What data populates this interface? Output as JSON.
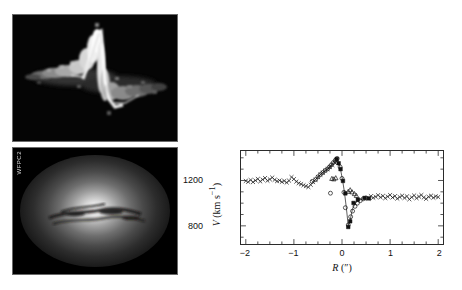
{
  "figure": {
    "panels": [
      {
        "id": "stis",
        "label": "STIS",
        "kind": "position-velocity-spectrogram"
      },
      {
        "id": "wfpc2",
        "label": "WFPC2",
        "kind": "optical-galaxy-image"
      }
    ]
  },
  "chart_data": {
    "type": "scatter",
    "title": "",
    "xlabel": "R (″)",
    "ylabel": "V (km s⁻¹)",
    "xlim": [
      -2.1,
      2.1
    ],
    "ylim": [
      640,
      1460
    ],
    "xticks": [
      -2,
      -1,
      0,
      1,
      2
    ],
    "xticklabels": [
      "−2",
      "−1",
      "0",
      "1",
      "2"
    ],
    "yticks": [
      800,
      1200
    ],
    "yticklabels": [
      "800",
      "1200"
    ],
    "minor_xticks": [
      -1.75,
      -1.5,
      -1.25,
      -0.75,
      -0.5,
      -0.25,
      0.25,
      0.5,
      0.75,
      1.25,
      1.5,
      1.75
    ],
    "minor_yticks": [
      700,
      900,
      1000,
      1100,
      1300,
      1400
    ],
    "grid": false,
    "legend": false,
    "series": [
      {
        "name": "ground-based long-slit (crosses)",
        "marker": "x",
        "points": [
          [
            -2.0,
            1196
          ],
          [
            -1.95,
            1188
          ],
          [
            -1.9,
            1204
          ],
          [
            -1.85,
            1186
          ],
          [
            -1.8,
            1200
          ],
          [
            -1.75,
            1214
          ],
          [
            -1.7,
            1192
          ],
          [
            -1.65,
            1208
          ],
          [
            -1.6,
            1222
          ],
          [
            -1.55,
            1198
          ],
          [
            -1.5,
            1210
          ],
          [
            -1.45,
            1226
          ],
          [
            -1.4,
            1206
          ],
          [
            -1.35,
            1194
          ],
          [
            -1.3,
            1200
          ],
          [
            -1.25,
            1188
          ],
          [
            -1.2,
            1196
          ],
          [
            -1.15,
            1182
          ],
          [
            -1.1,
            1198
          ],
          [
            -1.05,
            1230
          ],
          [
            -1.0,
            1212
          ],
          [
            -0.95,
            1190
          ],
          [
            -0.9,
            1176
          ],
          [
            -0.85,
            1168
          ],
          [
            -0.8,
            1158
          ],
          [
            -0.75,
            1150
          ],
          [
            -0.7,
            1142
          ],
          [
            -0.65,
            1162
          ],
          [
            -0.6,
            1186
          ],
          [
            -0.55,
            1206
          ],
          [
            -0.5,
            1230
          ],
          [
            -0.45,
            1252
          ],
          [
            -0.4,
            1268
          ],
          [
            -0.35,
            1286
          ],
          [
            -0.3,
            1300
          ],
          [
            -0.25,
            1318
          ],
          [
            -0.2,
            1336
          ],
          [
            -0.15,
            1356
          ],
          [
            -0.12,
            1372
          ],
          [
            0.55,
            1040
          ],
          [
            0.6,
            1062
          ],
          [
            0.65,
            1048
          ],
          [
            0.7,
            1056
          ],
          [
            0.75,
            1070
          ],
          [
            0.8,
            1052
          ],
          [
            0.85,
            1064
          ],
          [
            0.9,
            1044
          ],
          [
            0.95,
            1058
          ],
          [
            1.0,
            1072
          ],
          [
            1.05,
            1050
          ],
          [
            1.1,
            1062
          ],
          [
            1.15,
            1040
          ],
          [
            1.2,
            1054
          ],
          [
            1.25,
            1066
          ],
          [
            1.3,
            1046
          ],
          [
            1.35,
            1060
          ],
          [
            1.4,
            1034
          ],
          [
            1.45,
            1052
          ],
          [
            1.5,
            1068
          ],
          [
            1.55,
            1044
          ],
          [
            1.6,
            1058
          ],
          [
            1.65,
            1072
          ],
          [
            1.7,
            1050
          ],
          [
            1.75,
            1038
          ],
          [
            1.8,
            1056
          ],
          [
            1.85,
            1066
          ],
          [
            1.9,
            1048
          ],
          [
            1.95,
            1060
          ],
          [
            2.0,
            1054
          ]
        ]
      },
      {
        "name": "STIS gas velocities (open circles)",
        "marker": "o",
        "points": [
          [
            -0.62,
            1192
          ],
          [
            -0.55,
            1208
          ],
          [
            -0.5,
            1232
          ],
          [
            -0.45,
            1252
          ],
          [
            -0.4,
            1270
          ],
          [
            -0.35,
            1288
          ],
          [
            -0.3,
            1302
          ],
          [
            -0.26,
            1320
          ],
          [
            -0.22,
            1338
          ],
          [
            -0.18,
            1358
          ],
          [
            -0.14,
            1378
          ],
          [
            -0.1,
            1394
          ],
          [
            -0.24,
            1088
          ],
          [
            -0.04,
            1320
          ],
          [
            0.0,
            1218
          ],
          [
            0.04,
            1096
          ],
          [
            0.07,
            960
          ],
          [
            0.13,
            808
          ],
          [
            0.18,
            880
          ],
          [
            0.22,
            930
          ],
          [
            0.27,
            972
          ],
          [
            0.32,
            1000
          ],
          [
            0.38,
            1022
          ],
          [
            0.44,
            1038
          ],
          [
            0.5,
            1046
          ]
        ]
      },
      {
        "name": "model / best-fit sampled (filled squares)",
        "marker": "s",
        "points": [
          [
            -0.11,
            1390
          ],
          [
            -0.07,
            1352
          ],
          [
            -0.03,
            1300
          ],
          [
            0.02,
            1196
          ],
          [
            0.07,
            1086
          ],
          [
            0.13,
            790
          ],
          [
            0.17,
            840
          ],
          [
            0.24,
            1002
          ],
          [
            0.33,
            1032
          ],
          [
            0.47,
            1046
          ],
          [
            0.56,
            1042
          ]
        ]
      },
      {
        "name": "secondary component (open triangles)",
        "marker": "^",
        "points": [
          [
            -0.21,
            1216
          ],
          [
            -0.17,
            1212
          ],
          [
            -0.13,
            1222
          ],
          [
            0.13,
            1102
          ],
          [
            0.17,
            1116
          ],
          [
            0.21,
            1098
          ],
          [
            0.26,
            1082
          ],
          [
            0.3,
            1066
          ]
        ]
      }
    ],
    "model_curve": {
      "name": "keplerian model",
      "points": [
        [
          -0.3,
          1300
        ],
        [
          -0.22,
          1340
        ],
        [
          -0.16,
          1372
        ],
        [
          -0.11,
          1398
        ],
        [
          -0.07,
          1356
        ],
        [
          -0.03,
          1296
        ],
        [
          0.01,
          1208
        ],
        [
          0.05,
          1100
        ],
        [
          0.09,
          960
        ],
        [
          0.13,
          800
        ],
        [
          0.17,
          852
        ],
        [
          0.22,
          952
        ],
        [
          0.28,
          1002
        ],
        [
          0.36,
          1028
        ],
        [
          0.46,
          1042
        ],
        [
          0.56,
          1046
        ]
      ]
    }
  }
}
